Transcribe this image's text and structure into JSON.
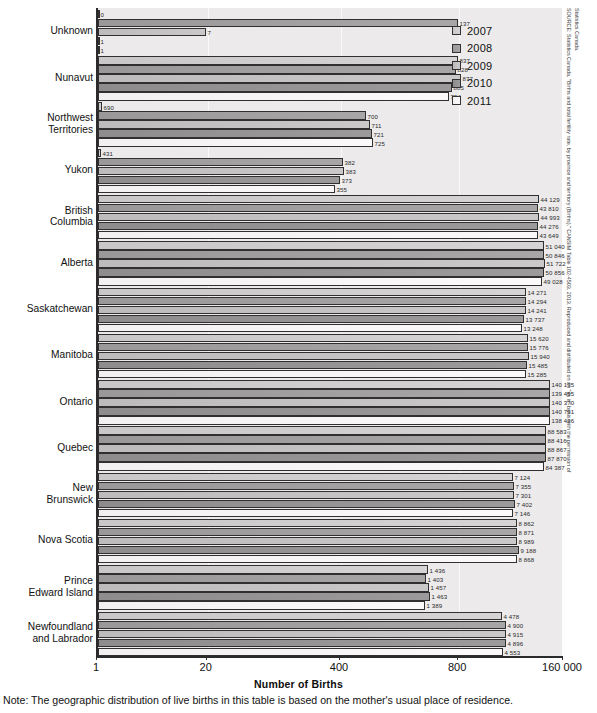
{
  "chart_data": {
    "type": "bar",
    "orientation": "horizontal",
    "title": "",
    "xlabel": "Number of Births",
    "ylabel": "",
    "grid": true,
    "legend_position": "top-right",
    "xticks": [
      "1",
      "20",
      "400",
      "800",
      "160 000"
    ],
    "xscale": "nonlinear-banded",
    "categories": [
      "Unknown",
      "Nunavut",
      "Northwest\nTerritories",
      "Yukon",
      "British\nColumbia",
      "Alberta",
      "Saskatchewan",
      "Manitoba",
      "Ontario",
      "Quebec",
      "New\nBrunswick",
      "Nova Scotia",
      "Prince\nEdward Island",
      "Newfoundland\nand Labrador"
    ],
    "series": [
      {
        "name": "2007",
        "values": [
          0,
          837,
          690,
          431,
          44129,
          51040,
          14271,
          15620,
          140135,
          88583,
          7124,
          8862,
          1436,
          4478
        ],
        "labels": [
          "0",
          "837",
          "690",
          "431",
          "44 129",
          "51 040",
          "14 271",
          "15 620",
          "140 135",
          "88 583",
          "7 124",
          "8 862",
          "1 436",
          "4 478"
        ]
      },
      {
        "name": "2008",
        "values": [
          137,
          828,
          700,
          382,
          43810,
          50846,
          14294,
          15776,
          139495,
          88416,
          7355,
          8871,
          1403,
          4900
        ],
        "labels": [
          "137",
          "828",
          "700",
          "382",
          "43 810",
          "50 846",
          "14 294",
          "15 776",
          "139 495",
          "88 416",
          "7 355",
          "8 871",
          "1 403",
          "4 900"
        ]
      },
      {
        "name": "2009",
        "values": [
          7,
          877,
          711,
          383,
          44993,
          51722,
          14241,
          15940,
          140370,
          88867,
          7301,
          8989,
          1457,
          4915
        ],
        "labels": [
          "7",
          "877",
          "711",
          "383",
          "44 993",
          "51 722",
          "14 241",
          "15 940",
          "140 370",
          "88 867",
          "7 301",
          "8 989",
          "1 457",
          "4 915"
        ]
      },
      {
        "name": "2010",
        "values": [
          1,
          805,
          721,
          373,
          44276,
          50856,
          13737,
          15485,
          140791,
          87870,
          7402,
          9188,
          1463,
          4896
        ],
        "labels": [
          "1",
          "805",
          "721",
          "373",
          "44 276",
          "50 856",
          "13 737",
          "15 485",
          "140 791",
          "87 870",
          "7 402",
          "9 188",
          "1 463",
          "4 896"
        ]
      },
      {
        "name": "2011",
        "values": [
          1,
          794,
          725,
          355,
          43649,
          49028,
          13248,
          15285,
          138436,
          84387,
          7146,
          8868,
          1389,
          4553
        ],
        "labels": [
          "1",
          "794",
          "725",
          "355",
          "43 649",
          "49 028",
          "13 248",
          "15 285",
          "138 436",
          "84 387",
          "7 146",
          "8 868",
          "1 389",
          "4 553"
        ]
      }
    ],
    "bar_pixel_widths": [
      [
        1,
        360,
        4,
        3,
        441,
        446,
        428,
        430,
        452,
        448,
        415,
        419,
        330,
        404
      ],
      [
        360,
        358,
        268,
        245,
        440,
        446,
        428,
        430,
        452,
        448,
        416,
        419,
        328,
        408
      ],
      [
        108,
        363,
        272,
        246,
        441,
        447,
        428,
        431,
        452,
        448,
        416,
        419,
        331,
        408
      ],
      [
        1,
        354,
        274,
        242,
        440,
        446,
        426,
        429,
        452,
        448,
        417,
        421,
        332,
        408
      ],
      [
        1,
        351,
        275,
        237,
        440,
        444,
        424,
        428,
        452,
        446,
        415,
        419,
        327,
        405
      ]
    ]
  },
  "legend": {
    "items": [
      {
        "label": "2007",
        "color": "#d0cece"
      },
      {
        "label": "2008",
        "color": "#a09e9e"
      },
      {
        "label": "2009",
        "color": "#c3c1c1"
      },
      {
        "label": "2010",
        "color": "#949292"
      },
      {
        "label": "2011",
        "color": "#f6f4f4"
      }
    ]
  },
  "note": "Note: The geographic distribution of live births in this table is based on the mother's usual place of residence.",
  "source": {
    "line1": "SOURCE: Statistics Canada, \"Births and total fertility rate, by province and territory (Births),\" CANSIM Table 102-4503, 2013. Reproduced and distributed on an \"as is\" basis with the permission of",
    "line2": "Statistics Canada."
  }
}
